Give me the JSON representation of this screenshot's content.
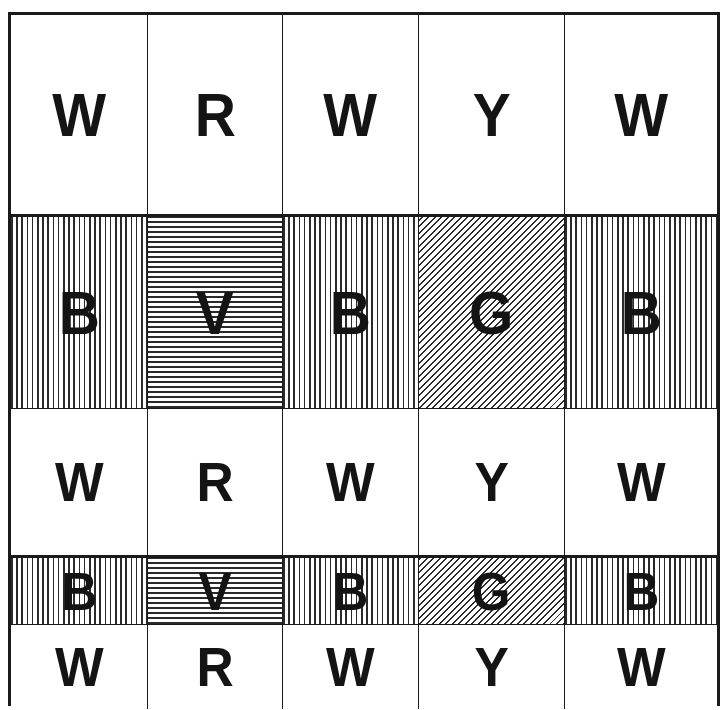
{
  "diagram": {
    "title": "",
    "colors": {
      "ink": "#141414",
      "background": "#ffffff"
    },
    "columns_px": [
      0,
      137,
      272,
      408,
      554,
      706
    ],
    "rows": [
      {
        "height": 200,
        "cells": [
          {
            "letter": "W",
            "fill": "white"
          },
          {
            "letter": "R",
            "fill": "white"
          },
          {
            "letter": "W",
            "fill": "white"
          },
          {
            "letter": "Y",
            "fill": "white"
          },
          {
            "letter": "W",
            "fill": "white"
          }
        ]
      },
      {
        "height": 194,
        "cells": [
          {
            "letter": "B",
            "fill": "vertical-hatch"
          },
          {
            "letter": "V",
            "fill": "horizontal-hatch"
          },
          {
            "letter": "B",
            "fill": "vertical-hatch"
          },
          {
            "letter": "G",
            "fill": "diagonal-hatch"
          },
          {
            "letter": "B",
            "fill": "vertical-hatch"
          }
        ]
      },
      {
        "height": 147,
        "cells": [
          {
            "letter": "W",
            "fill": "white"
          },
          {
            "letter": "R",
            "fill": "white"
          },
          {
            "letter": "W",
            "fill": "white"
          },
          {
            "letter": "Y",
            "fill": "white"
          },
          {
            "letter": "W",
            "fill": "white"
          }
        ]
      },
      {
        "height": 69,
        "cells": [
          {
            "letter": "B",
            "fill": "vertical-hatch"
          },
          {
            "letter": "V",
            "fill": "horizontal-hatch"
          },
          {
            "letter": "B",
            "fill": "vertical-hatch"
          },
          {
            "letter": "G",
            "fill": "diagonal-hatch"
          },
          {
            "letter": "B",
            "fill": "vertical-hatch"
          }
        ]
      },
      {
        "height": 84,
        "cells": [
          {
            "letter": "W",
            "fill": "white"
          },
          {
            "letter": "R",
            "fill": "white"
          },
          {
            "letter": "W",
            "fill": "white"
          },
          {
            "letter": "Y",
            "fill": "white"
          },
          {
            "letter": "W",
            "fill": "white"
          }
        ]
      }
    ]
  }
}
